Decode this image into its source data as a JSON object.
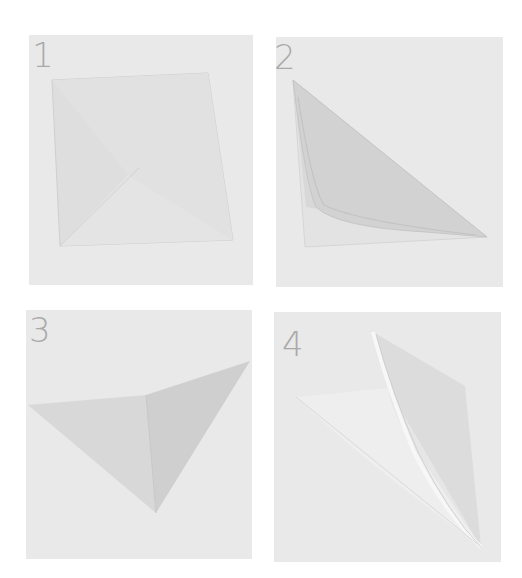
{
  "diagram": {
    "type": "folding-instructions",
    "panels": [
      {
        "step": "1",
        "description": "Square sheet with first diagonal fold begun"
      },
      {
        "step": "2",
        "description": "Sheet folded along diagonal into triangle"
      },
      {
        "step": "3",
        "description": "Triangle with corner folded over"
      },
      {
        "step": "4",
        "description": "Flap lifted and creased into point"
      }
    ]
  },
  "colors": {
    "panel_background": "#e9e9e9",
    "step_number": "#a9a9a9",
    "paper_light": "#e2e2e2",
    "paper_mid": "#d9d9d9",
    "paper_dark": "#cfcfcf",
    "paper_highlight": "#f2f2f2"
  }
}
